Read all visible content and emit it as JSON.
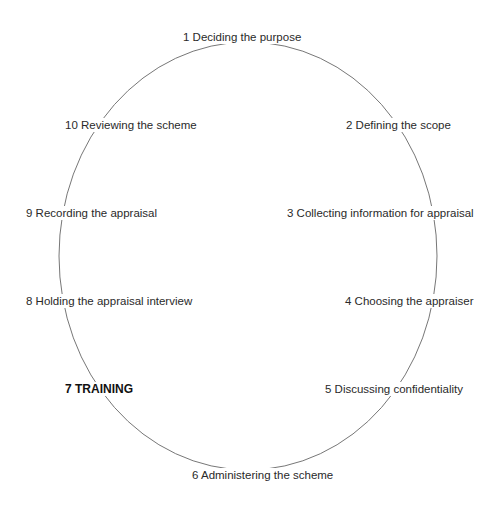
{
  "diagram": {
    "type": "cycle",
    "shape": "ellipse",
    "ellipse": {
      "cx": 248,
      "cy": 256,
      "rx": 189,
      "ry": 214,
      "stroke": "#777777"
    },
    "steps": [
      {
        "number": 1,
        "label": "1 Deciding the purpose",
        "emphasis": false
      },
      {
        "number": 2,
        "label": "2 Defining the scope",
        "emphasis": false
      },
      {
        "number": 3,
        "label": "3 Collecting information for appraisal",
        "emphasis": false
      },
      {
        "number": 4,
        "label": "4 Choosing the appraiser",
        "emphasis": false
      },
      {
        "number": 5,
        "label": "5 Discussing confidentiality",
        "emphasis": false
      },
      {
        "number": 6,
        "label": "6 Administering the scheme",
        "emphasis": false
      },
      {
        "number": 7,
        "label": "7 TRAINING",
        "emphasis": true
      },
      {
        "number": 8,
        "label": "8 Holding the appraisal interview",
        "emphasis": false
      },
      {
        "number": 9,
        "label": "9 Recording the appraisal",
        "emphasis": false
      },
      {
        "number": 10,
        "label": "10 Reviewing the scheme",
        "emphasis": false
      }
    ]
  }
}
